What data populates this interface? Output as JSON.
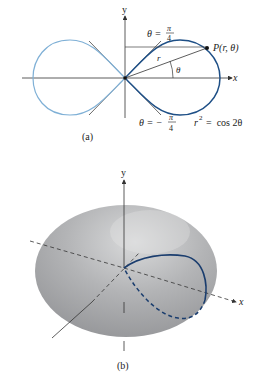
{
  "figure_a": {
    "caption": "(a)",
    "axis_x_label": "x",
    "axis_y_label": "y",
    "point_label": "P(r, θ)",
    "radius_label": "r",
    "angle_label": "θ",
    "tangent_upper": {
      "lhs": "θ =",
      "num": "π",
      "den": "4"
    },
    "tangent_lower": {
      "lhs": "θ = −",
      "num": "π",
      "den": "4"
    },
    "equation": {
      "r": "r",
      "exp": "2",
      "rhs": "=  cos 2θ"
    },
    "colors": {
      "right_loop": "#1e4f86",
      "left_loop": "#7fb0d6",
      "axes": "#333333"
    }
  },
  "figure_b": {
    "caption": "(b)",
    "axis_x_label": "x",
    "axis_y_label": "y",
    "colors": {
      "curve": "#1a3d6e",
      "surface": "#a9a9ab",
      "axes": "#333333"
    }
  }
}
